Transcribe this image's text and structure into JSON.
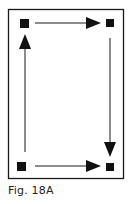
{
  "figure": {
    "caption": "Fig. 18A",
    "colors": {
      "stroke": "#1a1a1a",
      "node": "#111111",
      "background": "#ffffff"
    },
    "nodes": [
      {
        "id": "top-left",
        "x": 20,
        "y": 19
      },
      {
        "id": "top-right",
        "x": 106,
        "y": 19
      },
      {
        "id": "bottom-right",
        "x": 106,
        "y": 163
      },
      {
        "id": "bottom-left",
        "x": 17,
        "y": 162
      }
    ],
    "arrows": [
      {
        "from": "bottom-left",
        "to": "top-left",
        "direction": "up"
      },
      {
        "from": "top-left",
        "to": "top-right",
        "direction": "right"
      },
      {
        "from": "top-right",
        "to": "bottom-right",
        "direction": "down"
      },
      {
        "from": "bottom-left",
        "to": "bottom-right",
        "direction": "right"
      }
    ]
  }
}
